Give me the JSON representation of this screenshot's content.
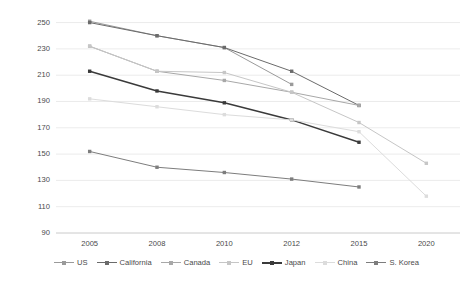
{
  "chart_data": {
    "type": "line",
    "title": "",
    "subtitle": "",
    "xlabel": "",
    "ylabel": "Grams CO₂ per km normalized to NEDC test cycle",
    "categories": [
      "2005",
      "2008",
      "2010",
      "2012",
      "2015",
      "2020"
    ],
    "x": [
      2005,
      2008,
      2010,
      2012,
      2015,
      2020
    ],
    "ylim": [
      90,
      255
    ],
    "yticks": [
      90,
      110,
      130,
      150,
      170,
      190,
      210,
      230,
      250
    ],
    "xticks": [
      "2005",
      "2008",
      "2010",
      "2012",
      "2015",
      "2020"
    ],
    "grid": "horizontal",
    "legend_position": "bottom",
    "series": [
      {
        "name": "US",
        "color": "#9a9a9a",
        "x": [
          2005,
          2008,
          2010,
          2012
        ],
        "values": [
          251,
          240,
          231,
          203
        ]
      },
      {
        "name": "California",
        "color": "#6b6b6b",
        "x": [
          2005,
          2008,
          2010,
          2012,
          2015
        ],
        "values": [
          250,
          240,
          231,
          213,
          187
        ]
      },
      {
        "name": "Canada",
        "color": "#a8a8a8",
        "x": [
          2005,
          2008,
          2010,
          2012,
          2015
        ],
        "values": [
          232,
          213,
          206,
          197,
          187
        ]
      },
      {
        "name": "EU",
        "color": "#c6c6c6",
        "x": [
          2005,
          2008,
          2010,
          2012,
          2015,
          2020
        ],
        "values": [
          232,
          213,
          212,
          197,
          174,
          143
        ]
      },
      {
        "name": "Japan",
        "color": "#3a3a3a",
        "x": [
          2005,
          2008,
          2010,
          2012,
          2015
        ],
        "values": [
          213,
          198,
          189,
          176,
          159
        ]
      },
      {
        "name": "China",
        "color": "#dcdcdc",
        "x": [
          2005,
          2008,
          2010,
          2012,
          2015,
          2020
        ],
        "values": [
          192,
          186,
          180,
          176,
          167,
          118
        ]
      },
      {
        "name": "S. Korea",
        "color": "#7d7d7d",
        "x": [
          2005,
          2008,
          2010,
          2012,
          2015
        ],
        "values": [
          152,
          140,
          136,
          131,
          125
        ]
      }
    ]
  },
  "legend": {
    "items": [
      {
        "label": "US"
      },
      {
        "label": "California"
      },
      {
        "label": "Canada"
      },
      {
        "label": "EU"
      },
      {
        "label": "Japan"
      },
      {
        "label": "China"
      },
      {
        "label": "S. Korea"
      }
    ]
  },
  "colors": {
    "grid": "#e6e6e6",
    "axis": "#d4d4d4",
    "text": "#4a4a4a",
    "background": "#ffffff"
  }
}
